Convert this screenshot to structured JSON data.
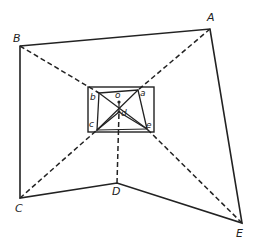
{
  "diagram": {
    "outer_vertices": [
      {
        "label": "A",
        "x": 210,
        "y": 29
      },
      {
        "label": "B",
        "x": 20,
        "y": 46
      },
      {
        "label": "C",
        "x": 20,
        "y": 198
      },
      {
        "label": "D",
        "x": 117,
        "y": 183
      },
      {
        "label": "E",
        "x": 242,
        "y": 223
      }
    ],
    "inner_vertices": [
      {
        "label": "a",
        "x": 138,
        "y": 90
      },
      {
        "label": "b",
        "x": 99,
        "y": 93
      },
      {
        "label": "c",
        "x": 97,
        "y": 130
      },
      {
        "label": "d",
        "x": 119,
        "y": 112
      },
      {
        "label": "e",
        "x": 147,
        "y": 129
      },
      {
        "label": "o",
        "x": 119,
        "y": 102
      }
    ],
    "inner_rectangle": {
      "x": 88,
      "y": 87,
      "width": 66,
      "height": 45
    },
    "colors": {
      "line": "#222222",
      "background": "#ffffff"
    }
  }
}
